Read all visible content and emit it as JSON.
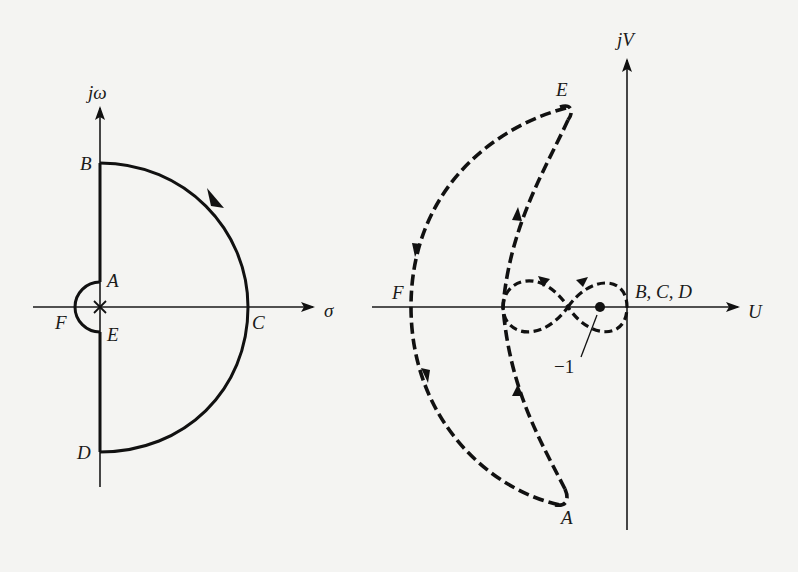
{
  "figure": {
    "colors": {
      "background": "#f4f4f2",
      "ink": "#111111"
    }
  },
  "s_plane": {
    "vertical_axis_label": "jω",
    "horizontal_axis_label": "σ",
    "pole_marker": "×",
    "contour_style": "solid",
    "points": {
      "A": "A",
      "B": "B",
      "C": "C",
      "D": "D",
      "E": "E",
      "F": "F"
    }
  },
  "nyquist_plane": {
    "vertical_axis_label": "jV",
    "horizontal_axis_label": "U",
    "contour_style": "dashed",
    "critical_point_label": "−1",
    "points": {
      "A": "A",
      "E": "E",
      "F": "F",
      "BCD": "B, C, D"
    }
  }
}
